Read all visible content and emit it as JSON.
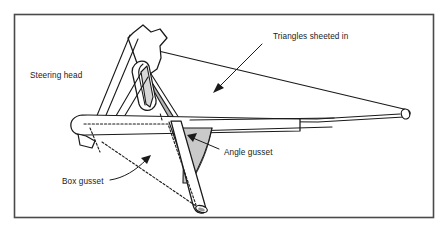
{
  "figure": {
    "type": "technical-line-diagram",
    "background_color": "#ffffff",
    "border_color": "#4a4a4a",
    "line_color": "#1a1a1a",
    "shade_color": "#c9c9c9",
    "shade_color_light": "#d8d8d8",
    "shade_color_dark": "#b4b4b4"
  },
  "labels": {
    "steering_head": "Steering head",
    "triangles_sheeted_in": "Triangles sheeted in",
    "angle_gusset": "Angle gusset",
    "box_gusset": "Box gusset"
  },
  "annotations": [
    {
      "id": "steering-head",
      "text": "Steering head",
      "x": 30,
      "y": 75,
      "leader": "none"
    },
    {
      "id": "triangles-sheeted-in",
      "text": "Triangles sheeted in",
      "x": 273,
      "y": 39,
      "leader": "arrow pointing down-left into shaded triangular panel"
    },
    {
      "id": "angle-gusset",
      "text": "Angle gusset",
      "x": 224,
      "y": 152,
      "leader": "arrow pointing up-left into curved shaded gusset"
    },
    {
      "id": "box-gusset",
      "text": "Box gusset",
      "x": 62,
      "y": 182,
      "leader": "curved arrow pointing up-right to dotted box outline"
    }
  ],
  "parts": [
    {
      "id": "steering-head-tube",
      "name": "Steering head tube",
      "shaded": false
    },
    {
      "id": "top-tube",
      "name": "Top tube",
      "shaded": false
    },
    {
      "id": "down-tube",
      "name": "Down tube",
      "shaded": false
    },
    {
      "id": "bottom-tube",
      "name": "Bottom / lower frame tube",
      "shaded": false
    },
    {
      "id": "sheeted-triangle",
      "name": "Sheeted-in triangle panel",
      "shaded": true
    },
    {
      "id": "angle-gusset-plate",
      "name": "Angle gusset plate",
      "shaded": true
    },
    {
      "id": "box-gusset-hidden",
      "name": "Box gusset (hidden, dotted)",
      "shaded": false
    }
  ]
}
